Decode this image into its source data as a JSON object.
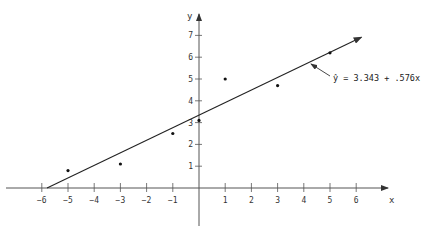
{
  "chart_data": {
    "type": "scatter",
    "title": "",
    "xlabel": "x",
    "ylabel": "y",
    "xlim": [
      -6.5,
      7.2
    ],
    "ylim": [
      -2.6,
      7.8
    ],
    "x_ticks": [
      -6,
      -5,
      -4,
      -3,
      -2,
      -1,
      1,
      2,
      3,
      4,
      5,
      6
    ],
    "y_ticks": [
      1,
      2,
      3,
      4,
      5,
      6,
      7
    ],
    "grid": false,
    "legend": null,
    "series": [
      {
        "name": "observations",
        "kind": "scatter",
        "points": [
          {
            "x": -5,
            "y": 0.8
          },
          {
            "x": -3,
            "y": 1.1
          },
          {
            "x": -1,
            "y": 2.5
          },
          {
            "x": 0,
            "y": 3.1
          },
          {
            "x": 1,
            "y": 5.0
          },
          {
            "x": 3,
            "y": 4.7
          },
          {
            "x": 5,
            "y": 6.2
          }
        ]
      },
      {
        "name": "fitted regression line",
        "kind": "line",
        "intercept": 3.343,
        "slope": 0.576,
        "x_range": [
          -5.8,
          6.2
        ]
      }
    ],
    "annotations": [
      {
        "text": "ŷ = 3.343 + .576x",
        "points_to": {
          "x": 4.2,
          "y": 5.76
        }
      }
    ]
  },
  "labels": {
    "x_axis": "x",
    "y_axis": "y",
    "equation": "ŷ = 3.343 + .576x",
    "x_ticks": [
      "−6",
      "−5",
      "−4",
      "−3",
      "−2",
      "−1",
      "1",
      "2",
      "3",
      "4",
      "5",
      "6"
    ],
    "y_ticks": [
      "1",
      "2",
      "3",
      "4",
      "5",
      "6",
      "7"
    ]
  },
  "colors": {
    "axis": "#555555",
    "line": "#222222",
    "points": "#111111",
    "text": "#333333"
  }
}
